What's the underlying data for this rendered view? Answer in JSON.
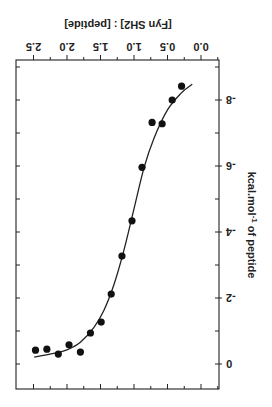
{
  "chart_data": {
    "type": "scatter",
    "orientation_note": "figure displayed rotated 180 degrees",
    "title": "",
    "xlabel": "[Fyn SH2] : [peptide]",
    "ylabel": "kcal.mol-1 of peptide",
    "ylabel_parts": {
      "base": "kcal.mol",
      "sup": "-1",
      "rest": " of peptide"
    },
    "xlim": [
      -0.55,
      2.75
    ],
    "ylim": [
      -9.2,
      0.75
    ],
    "xticks": [
      0.0,
      0.5,
      1.0,
      1.5,
      2.0,
      2.5
    ],
    "xtick_labels": [
      "0.0",
      "0.5",
      "1.0",
      "1.5",
      "2.0",
      "2.5"
    ],
    "xminor_step": 0.25,
    "yticks": [
      -8,
      -6,
      -4,
      -2,
      0
    ],
    "ytick_labels": [
      "-8",
      "-6",
      "-4",
      "-2",
      "0"
    ],
    "yminor_step": 1,
    "grid": false,
    "legend": null,
    "series": [
      {
        "name": "data",
        "kind": "scatter",
        "x": [
          0.29,
          0.43,
          0.58,
          0.73,
          0.88,
          1.03,
          1.18,
          1.34,
          1.49,
          1.65,
          1.8,
          1.97,
          2.13,
          2.3,
          2.47
        ],
        "y": [
          -8.42,
          -8.0,
          -7.28,
          -7.32,
          -5.96,
          -4.34,
          -3.27,
          -2.12,
          -1.27,
          -0.94,
          -0.36,
          -0.58,
          -0.3,
          -0.45,
          -0.42
        ]
      },
      {
        "name": "fit",
        "kind": "line",
        "x": [
          0.13,
          0.3,
          0.5,
          0.7,
          0.85,
          1.0,
          1.15,
          1.3,
          1.45,
          1.6,
          1.8,
          2.0,
          2.2,
          2.49
        ],
        "y": [
          -8.48,
          -8.2,
          -7.7,
          -6.85,
          -5.95,
          -4.7,
          -3.45,
          -2.4,
          -1.62,
          -1.1,
          -0.66,
          -0.43,
          -0.32,
          -0.21
        ]
      }
    ]
  }
}
